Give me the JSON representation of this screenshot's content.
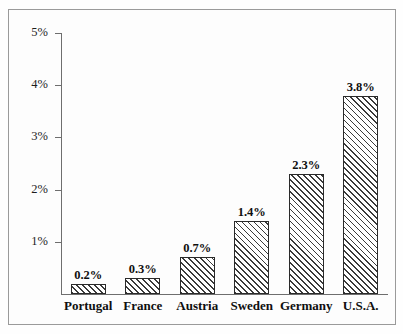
{
  "chart_data": {
    "type": "bar",
    "title": "",
    "subtitle": "",
    "xlabel": "",
    "ylabel": "",
    "categories": [
      "Portugal",
      "France",
      "Austria",
      "Sweden",
      "Germany",
      "U.S.A."
    ],
    "values": [
      0.2,
      0.3,
      0.7,
      1.4,
      2.3,
      3.8
    ],
    "value_labels": [
      "0.2%",
      "0.3%",
      "0.7%",
      "1.4%",
      "2.3%",
      "3.8%"
    ],
    "ylim": [
      0,
      5
    ],
    "ytick_values": [
      1,
      2,
      3,
      4,
      5
    ],
    "ytick_labels": [
      "1%",
      "2%",
      "3%",
      "4%",
      "5%"
    ],
    "grid": false,
    "legend": null,
    "annotations": [],
    "bar_fill": "diagonal-hatch",
    "colors": {
      "bar_outline": "#2a2a2a",
      "bar_hatch": "#3a3a3a",
      "bar_background": "#ffffff",
      "axis": "#6e6e6e",
      "frame": "#9a9a9a",
      "text": "#0f0f0f",
      "tick_text": "#1d1d1d",
      "page_background": "#fdfdfd"
    }
  }
}
